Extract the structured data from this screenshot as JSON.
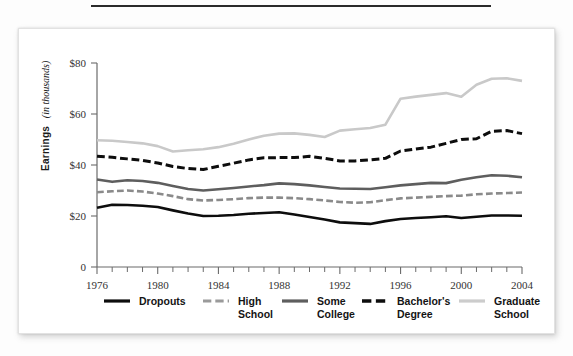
{
  "figure": {
    "y_axis_label_bold": "Earnings",
    "y_axis_label_italic": "(in thousands)"
  },
  "chart_data": {
    "type": "line",
    "title": "",
    "subtitle": "",
    "xlabel": "",
    "ylabel": "Earnings (in thousands)",
    "ylabel_bold_part": "Earnings",
    "ylabel_italic_part": "(in thousands)",
    "grid": false,
    "legend_position": "bottom",
    "xlim": [
      1976,
      2004
    ],
    "ylim": [
      0,
      80
    ],
    "y_ticks": [
      0,
      20,
      40,
      60,
      80
    ],
    "y_tick_labels": [
      "0",
      "$20",
      "$40",
      "$60",
      "$80"
    ],
    "x_ticks": [
      1976,
      1980,
      1984,
      1988,
      1992,
      1996,
      2000,
      2004
    ],
    "x_tick_labels": [
      "1976",
      "1980",
      "1984",
      "1988",
      "1992",
      "1996",
      "2000",
      "2004"
    ],
    "x_minor_tick_interval": 1,
    "x": [
      1976,
      1977,
      1978,
      1979,
      1980,
      1981,
      1982,
      1983,
      1984,
      1985,
      1986,
      1987,
      1988,
      1989,
      1990,
      1991,
      1992,
      1993,
      1994,
      1995,
      1996,
      1997,
      1998,
      1999,
      2000,
      2001,
      2002,
      2003,
      2004
    ],
    "series": [
      {
        "name": "Dropouts",
        "color": "#0d0d0d",
        "style": "solid",
        "width": 2.6,
        "values": [
          23.2,
          24.4,
          24.3,
          24.0,
          23.5,
          22.2,
          21.0,
          20.0,
          20.1,
          20.4,
          20.9,
          21.2,
          21.5,
          20.6,
          19.6,
          18.6,
          17.5,
          17.2,
          16.9,
          18.0,
          18.8,
          19.2,
          19.5,
          19.9,
          19.2,
          19.7,
          20.2,
          20.2,
          20.1
        ]
      },
      {
        "name": "High School",
        "color": "#8a8a8a",
        "style": "dashed",
        "width": 2.6,
        "values": [
          29.3,
          29.7,
          30.0,
          29.6,
          28.8,
          27.8,
          26.6,
          26.1,
          26.3,
          26.6,
          27.0,
          27.2,
          27.2,
          27.0,
          26.6,
          26.1,
          25.5,
          25.2,
          25.4,
          26.2,
          26.9,
          27.2,
          27.5,
          27.8,
          28.0,
          28.5,
          28.8,
          29.0,
          29.2
        ]
      },
      {
        "name": "Some College",
        "color": "#5e5e5e",
        "style": "solid",
        "width": 2.6,
        "values": [
          34.3,
          33.4,
          34.0,
          33.7,
          33.0,
          31.8,
          30.6,
          30.0,
          30.5,
          31.0,
          31.6,
          32.1,
          32.8,
          32.5,
          32.0,
          31.4,
          30.8,
          30.7,
          30.6,
          31.3,
          32.0,
          32.5,
          33.0,
          32.9,
          34.2,
          35.2,
          36.0,
          35.8,
          35.2
        ]
      },
      {
        "name": "Bachelor's Degree",
        "color": "#0d0d0d",
        "style": "dashed",
        "width": 3.0,
        "values": [
          43.4,
          43.0,
          42.4,
          41.8,
          40.8,
          39.4,
          38.6,
          38.2,
          39.5,
          40.7,
          42.0,
          42.8,
          42.9,
          42.9,
          43.4,
          42.6,
          41.6,
          41.6,
          42.0,
          42.6,
          45.5,
          46.3,
          47.0,
          48.5,
          50.0,
          50.3,
          53.2,
          53.5,
          52.3
        ]
      },
      {
        "name": "Graduate School",
        "color": "#c9c9c9",
        "style": "solid",
        "width": 2.6,
        "values": [
          49.7,
          49.5,
          49.0,
          48.5,
          47.4,
          45.3,
          45.8,
          46.2,
          47.0,
          48.3,
          50.0,
          51.5,
          52.3,
          52.4,
          51.8,
          51.0,
          53.5,
          54.0,
          54.5,
          55.8,
          66.0,
          66.8,
          67.5,
          68.2,
          66.8,
          71.5,
          73.8,
          74.0,
          73.0
        ]
      }
    ]
  },
  "legend": {
    "items": [
      {
        "label_line1": "Dropouts",
        "label_line2": "",
        "color": "#0d0d0d",
        "style": "solid",
        "width": 3.2
      },
      {
        "label_line1": "High",
        "label_line2": "School",
        "color": "#9a9a9a",
        "style": "dashed",
        "width": 3.2
      },
      {
        "label_line1": "Some",
        "label_line2": "College",
        "color": "#5e5e5e",
        "style": "solid",
        "width": 3.2
      },
      {
        "label_line1": "Bachelor's",
        "label_line2": "Degree",
        "color": "#0d0d0d",
        "style": "dashed",
        "width": 3.6
      },
      {
        "label_line1": "Graduate",
        "label_line2": "School",
        "color": "#cccccc",
        "style": "solid",
        "width": 3.2
      }
    ]
  }
}
